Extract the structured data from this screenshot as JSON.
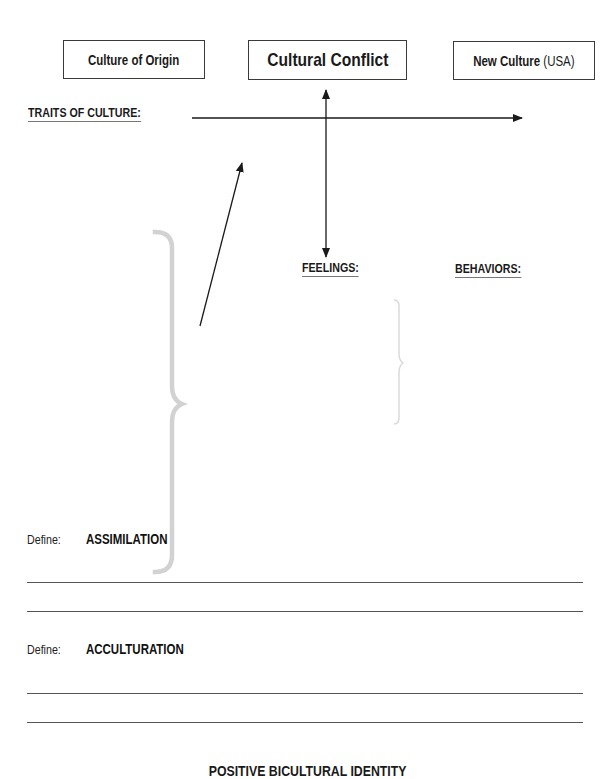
{
  "boxes": {
    "origin": {
      "label": "Culture of Origin"
    },
    "conflict": {
      "label": "Cultural Conflict"
    },
    "new_culture": {
      "label_bold": "New Culture",
      "label_light": "(USA)"
    }
  },
  "headings": {
    "traits": "TRAITS OF CULTURE:",
    "feelings": "FEELINGS:",
    "behaviors": "BEHAVIORS:"
  },
  "definitions": [
    {
      "prompt": "Define:",
      "term": "ASSIMILATION",
      "answer_lines": 2
    },
    {
      "prompt": "Define:",
      "term": "ACCULTURATION",
      "answer_lines": 2
    }
  ],
  "footer": {
    "title": "POSITIVE BICULTURAL IDENTITY"
  },
  "icons": {
    "horizontal_arrow": "arrow-right",
    "vertical_arrow": "arrow-up-down",
    "diagonal_arrow": "arrow-up-right",
    "large_brace": "curly-brace-right",
    "small_brace": "curly-brace-right"
  },
  "colors": {
    "ink": "#1a1a1a",
    "brace_gray": "#d0d0d0",
    "rule_gray": "#555555"
  }
}
